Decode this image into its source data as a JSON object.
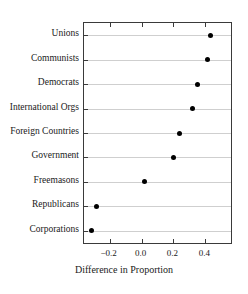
{
  "chart_data": {
    "type": "scatter",
    "title": "",
    "xlabel": "Difference in Proportion",
    "ylabel": "",
    "orientation": "horizontal",
    "grid": true,
    "legend": null,
    "xlim": [
      -0.36,
      0.56
    ],
    "xticks": [
      -0.2,
      0.0,
      0.2,
      0.4
    ],
    "xtick_labels": [
      "−0.2",
      "0.0",
      "0.2",
      "0.4"
    ],
    "categories": [
      "Unions",
      "Communists",
      "Democrats",
      "International Orgs",
      "Foreign Countries",
      "Government",
      "Freemasons",
      "Republicans",
      "Corporations"
    ],
    "values": [
      0.43,
      0.41,
      0.35,
      0.32,
      0.24,
      0.2,
      0.02,
      -0.28,
      -0.31
    ],
    "marker": {
      "shape": "circle",
      "color": "#000000",
      "size_px": 5
    },
    "colors": {
      "axis": "#3a3a3a",
      "gridline": "#cfcfcf",
      "text": "#1a1a1a",
      "background": "#ffffff"
    }
  }
}
